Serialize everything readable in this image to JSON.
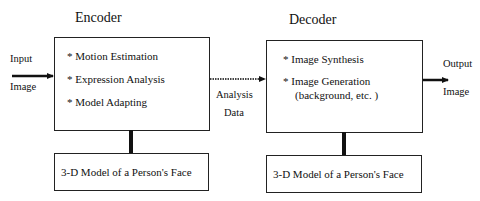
{
  "encoder": {
    "title": "Encoder",
    "items": [
      "* Motion Estimation",
      "* Expression Analysis",
      "* Model Adapting"
    ],
    "model_label": "3-D Model of a Person's Face"
  },
  "decoder": {
    "title": "Decoder",
    "items": [
      "* Image Synthesis",
      "* Image Generation",
      "(background, etc. )"
    ],
    "model_label": "3-D Model of a Person's Face"
  },
  "input": {
    "line1": "Input",
    "line2": "Image"
  },
  "output": {
    "line1": "Output",
    "line2": "Image"
  },
  "channel": {
    "line1": "Analysis",
    "line2": "Data"
  }
}
